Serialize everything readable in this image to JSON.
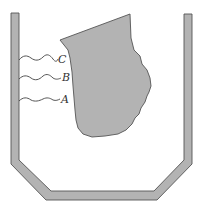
{
  "diagram": {
    "type": "crucible-with-melting-solid",
    "colors": {
      "fill": "#b3b3b3",
      "stroke": "#555555",
      "wave": "#444444",
      "label": "#333333",
      "background": "#ffffff"
    },
    "container": {
      "description": "open-top vessel with angled bottom"
    },
    "solid": {
      "description": "irregular solid lump"
    },
    "labels": [
      {
        "id": "C",
        "text": "C"
      },
      {
        "id": "B",
        "text": "B"
      },
      {
        "id": "A",
        "text": "A"
      }
    ]
  }
}
